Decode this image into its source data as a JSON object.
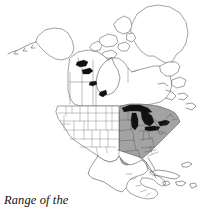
{
  "figure": {
    "title": "Range of the gray treefrog",
    "caption_lines": [
      "Range of the",
      "gray treefrog"
    ],
    "subject": "gray treefrog",
    "map_region": "North America",
    "projection_note": "continental outline map"
  },
  "legend": {
    "shaded_meaning": "Range of the gray treefrog",
    "shaded_color": "#a3a3a3",
    "water_color": "#111111",
    "outline_color": "#4a4a4a",
    "background_color": "#ffffff"
  },
  "map_data": {
    "type": "range-map",
    "shaded_areas": [
      "Minnesota",
      "Iowa",
      "Missouri",
      "Arkansas",
      "Louisiana",
      "Wisconsin",
      "Illinois",
      "Michigan",
      "Indiana",
      "Ohio",
      "Kentucky",
      "Tennessee",
      "Mississippi",
      "Alabama",
      "Georgia",
      "Florida panhandle",
      "South Carolina",
      "North Carolina",
      "Virginia",
      "West Virginia",
      "Pennsylvania",
      "New York",
      "New Jersey",
      "Maryland",
      "Delaware",
      "Connecticut",
      "Massachusetts",
      "Vermont",
      "New Hampshire",
      "Maine",
      "eastern Texas",
      "eastern Oklahoma",
      "eastern Kansas",
      "southern Ontario",
      "southern Quebec",
      "New Brunswick"
    ],
    "unshaded_areas": [
      "Alaska",
      "Yukon",
      "Northwest Territories",
      "Nunavut",
      "British Columbia",
      "Alberta",
      "Saskatchewan",
      "Manitoba",
      "Greenland",
      "Washington",
      "Oregon",
      "California",
      "Idaho",
      "Nevada",
      "Utah",
      "Arizona",
      "Montana",
      "Wyoming",
      "Colorado",
      "New Mexico",
      "North Dakota",
      "South Dakota",
      "Nebraska",
      "western Kansas",
      "western Texas",
      "Mexico",
      "Cuba",
      "Central America",
      "Caribbean islands"
    ],
    "black_water_bodies": [
      "Great Bear Lake",
      "Great Slave Lake",
      "Lake Athabasca",
      "Lake Winnipeg",
      "Lake Superior",
      "Lake Michigan",
      "Lake Huron",
      "Lake Erie",
      "Lake Ontario"
    ]
  }
}
